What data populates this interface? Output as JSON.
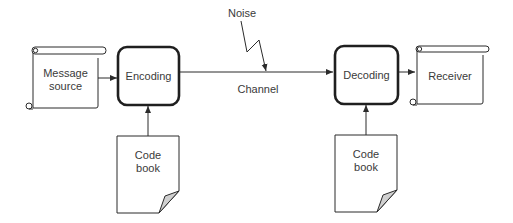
{
  "diagram": {
    "type": "flow",
    "title": "",
    "nodes": [
      {
        "id": "message_source",
        "shape": "scroll",
        "label_lines": [
          "Message",
          "source"
        ]
      },
      {
        "id": "encoding",
        "shape": "rounded-rect",
        "label": "Encoding"
      },
      {
        "id": "decoding",
        "shape": "rounded-rect",
        "label": "Decoding"
      },
      {
        "id": "receiver",
        "shape": "scroll",
        "label": "Receiver"
      },
      {
        "id": "code_book_1",
        "shape": "document",
        "label_lines": [
          "Code",
          "book"
        ]
      },
      {
        "id": "code_book_2",
        "shape": "document",
        "label_lines": [
          "Code",
          "book"
        ]
      }
    ],
    "edges": [
      {
        "from": "message_source",
        "to": "encoding"
      },
      {
        "from": "encoding",
        "to": "decoding",
        "label": "Channel"
      },
      {
        "from": "decoding",
        "to": "receiver"
      },
      {
        "from": "code_book_1",
        "to": "encoding"
      },
      {
        "from": "code_book_2",
        "to": "decoding"
      },
      {
        "from": "noise",
        "to": "channel",
        "style": "lightning"
      }
    ],
    "noise_label": "Noise",
    "channel_label": "Channel"
  },
  "labels": {
    "message_source_1": "Message",
    "message_source_2": "source",
    "encoding": "Encoding",
    "decoding": "Decoding",
    "receiver": "Receiver",
    "code_book_a_1": "Code",
    "code_book_a_2": "book",
    "code_book_b_1": "Code",
    "code_book_b_2": "book",
    "noise": "Noise",
    "channel": "Channel"
  },
  "colors": {
    "stroke": "#2b2b2b",
    "text": "#3a3a3a",
    "fold": "#d0d0d0",
    "background": "#ffffff"
  }
}
